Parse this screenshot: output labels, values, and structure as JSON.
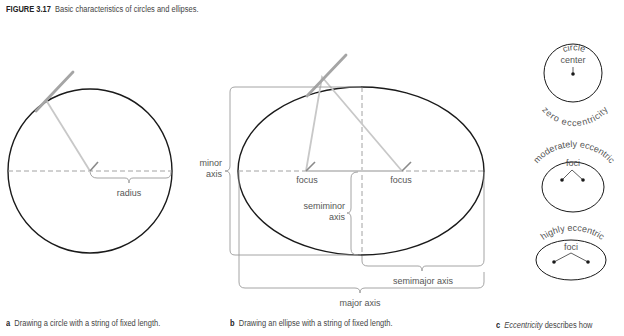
{
  "figure": {
    "number": "FIGURE 3.17",
    "title": "Basic characteristics of circles and ellipses."
  },
  "panel_a": {
    "letter": "a",
    "caption": "Drawing a circle with a string of fixed length.",
    "labels": {
      "radius": "radius"
    }
  },
  "panel_b": {
    "letter": "b",
    "caption": "Drawing an ellipse with a string of fixed length.",
    "labels": {
      "minor_axis_1": "minor",
      "minor_axis_2": "axis",
      "focus_left": "focus",
      "focus_right": "focus",
      "semiminor_1": "semiminor",
      "semiminor_2": "axis",
      "semimajor": "semimajor axis",
      "major": "major axis"
    }
  },
  "panel_c": {
    "letter": "c",
    "caption_italic": "Eccentricity",
    "caption_rest": " describes how",
    "circle": {
      "top": "circle",
      "center": "center",
      "bottom": "zero eccentricity"
    },
    "moderate": {
      "top": "moderately eccentric",
      "foci": "foci"
    },
    "high": {
      "top": "highly eccentric",
      "foci": "foci"
    }
  },
  "colors": {
    "outline": "#1a1a1a",
    "string": "#c8c8c8",
    "pencil": "#9a9a9a",
    "bracket": "#9a9a9a",
    "dash": "#8a8a8a",
    "text": "#555555"
  }
}
